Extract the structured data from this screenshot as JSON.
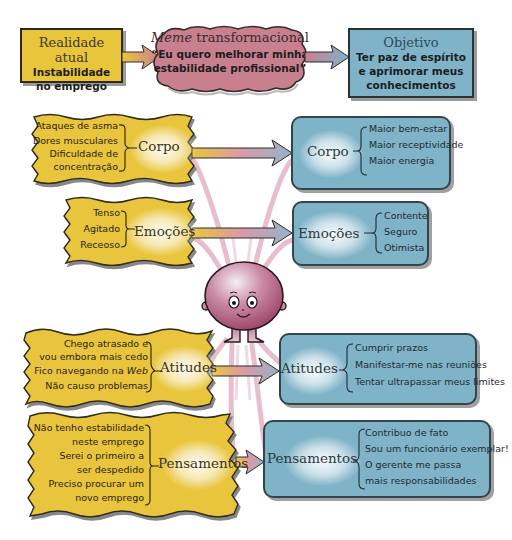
{
  "top": {
    "reality": {
      "title": "Realidade atual",
      "line1": "Instabilidade",
      "line2": "no emprego"
    },
    "meme": {
      "title_italic": "Meme",
      "title_rest": " transformacional",
      "line1": "“Eu quero melhorar minha",
      "line2": "estabilidade profissional”"
    },
    "goal": {
      "title": "Objetivo",
      "line1": "Ter paz de espírito",
      "line2": "e aprimorar meus",
      "line3": "conhecimentos"
    }
  },
  "left": {
    "corpo": {
      "label": "Corpo",
      "items": [
        "Ataques de asma",
        "Dores musculares",
        "Dificuldade de",
        "concentração"
      ]
    },
    "emocoes": {
      "label": "Emoções",
      "items": [
        "Tenso",
        "Agitado",
        "Receoso"
      ]
    },
    "atitudes": {
      "label": "Atitudes",
      "items": [
        "Chego atrasado e",
        "vou embora mais cedo",
        "Fico navegando na ",
        "Web",
        "Não causo problemas"
      ]
    },
    "pensamentos": {
      "label": "Pensamentos",
      "items": [
        "Não tenho estabilidade",
        "neste emprego",
        "Serei o primeiro a",
        "ser despedido",
        "Preciso procurar um",
        "novo emprego"
      ]
    }
  },
  "right": {
    "corpo": {
      "label": "Corpo",
      "items": [
        "Maior bem-estar",
        "Maior receptividade",
        "Maior energia"
      ]
    },
    "emocoes": {
      "label": "Emoções",
      "items": [
        "Contente",
        "Seguro",
        "Otimista"
      ]
    },
    "atitudes": {
      "label": "Atitudes",
      "items": [
        "Cumprir prazos",
        "Manifestar-me nas reuniões",
        "Tentar ultrapassar meus limites"
      ]
    },
    "pensamentos": {
      "label": "Pensamentos",
      "items": [
        "Contribuo de fato",
        "Sou um funcionário exemplar!",
        "O gerente me passa",
        "mais responsabilidades"
      ]
    }
  },
  "center": {
    "character": "smiling-head-character"
  },
  "colors": {
    "yellow": "#e9c53c",
    "blue": "#7fb3c8",
    "pink": "#c8808f",
    "arc_pink": "#e3aebf",
    "border_dark": "#2d2a1a"
  }
}
